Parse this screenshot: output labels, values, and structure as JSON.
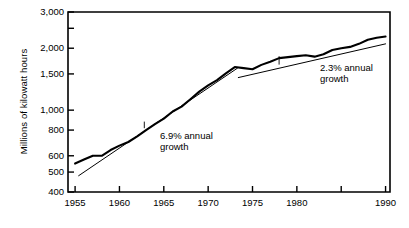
{
  "chart_data": {
    "type": "line",
    "title": "",
    "xlabel": "",
    "ylabel": "Millions of kilowatt hours",
    "yscale": "log",
    "ylim": [
      400,
      3000
    ],
    "xlim": [
      1954.2,
      1990.5
    ],
    "grid": false,
    "legend": null,
    "yticks": [
      400,
      500,
      600,
      800,
      1000,
      1500,
      2000,
      3000
    ],
    "ytick_labels": [
      "400",
      "500",
      "600",
      "800",
      "1,000",
      "1,500",
      "2,000",
      "3,000"
    ],
    "yticks_unlabeled": [
      2500
    ],
    "xticks": [
      1955,
      1960,
      1965,
      1970,
      1975,
      1980,
      1985,
      1990
    ],
    "xtick_labels": [
      "1955",
      "1960",
      "1965",
      "1970",
      "1975",
      "1980",
      "",
      "1990"
    ],
    "series": [
      {
        "name": "Electricity generation",
        "style": "thick-solid",
        "x": [
          1955,
          1956,
          1957,
          1958,
          1959,
          1960,
          1961,
          1962,
          1963,
          1964,
          1965,
          1966,
          1967,
          1968,
          1969,
          1970,
          1971,
          1972,
          1973,
          1974,
          1975,
          1976,
          1977,
          1978,
          1979,
          1980,
          1981,
          1982,
          1983,
          1984,
          1985,
          1986,
          1987,
          1988,
          1989,
          1990
        ],
        "values": [
          550,
          575,
          600,
          600,
          640,
          672,
          700,
          745,
          800,
          855,
          910,
          985,
          1040,
          1130,
          1230,
          1320,
          1400,
          1510,
          1620,
          1600,
          1580,
          1660,
          1720,
          1790,
          1810,
          1830,
          1850,
          1820,
          1870,
          1960,
          2000,
          2030,
          2100,
          2200,
          2250,
          2280
        ]
      },
      {
        "name": "6.9% annual growth trend",
        "style": "thin-solid",
        "x": [
          1955.4,
          1973.3
        ],
        "values": [
          480,
          1600
        ]
      },
      {
        "name": "2.3% annual growth trend",
        "style": "thin-solid",
        "x": [
          1973.4,
          1990
        ],
        "values": [
          1440,
          2100
        ]
      }
    ],
    "annotations": [
      {
        "text": "6.9% annual\ngrowth",
        "label_x": 1965.0,
        "label_y": 790,
        "leader_from_x": 1962.8,
        "leader_from_y": 880
      },
      {
        "text": "2.3% annual\ngrowth",
        "label_x": 1979.2,
        "label_y": 1610,
        "leader_from_x": 1978.0,
        "leader_from_y": 1830
      }
    ]
  },
  "colors": {
    "axis": "#000000",
    "line": "#000000",
    "background": "#ffffff"
  }
}
